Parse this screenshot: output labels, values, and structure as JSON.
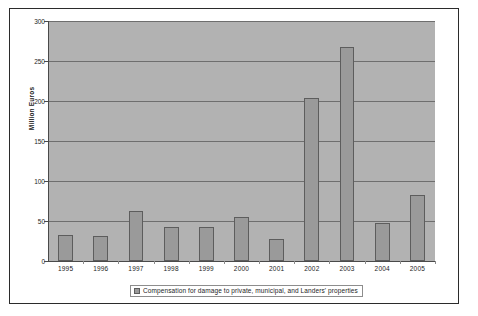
{
  "chart_data": {
    "type": "bar",
    "title": "",
    "subtitle": "",
    "xlabel": "",
    "ylabel": "Million Euros",
    "categories": [
      "1995",
      "1996",
      "1997",
      "1998",
      "1999",
      "2000",
      "2001",
      "2002",
      "2003",
      "2004",
      "2005"
    ],
    "values": [
      32,
      31,
      63,
      43,
      43,
      55,
      27,
      204,
      267,
      48,
      82
    ],
    "series": [
      {
        "name": "Compensation for damage to private, municipal, and Landers' properties",
        "values": [
          32,
          31,
          63,
          43,
          43,
          55,
          27,
          204,
          267,
          48,
          82
        ]
      }
    ],
    "ylim": [
      0,
      300
    ],
    "yticks": [
      0,
      50,
      100,
      150,
      200,
      250,
      300
    ],
    "ytick_labels": [
      "0",
      "50",
      "100",
      "150",
      "200",
      "250",
      "300"
    ],
    "grid": true,
    "legend_position": "bottom",
    "legend_entries": [
      "Compensation for damage to private, municipal, and Landers' properties"
    ],
    "colors": {
      "bar_fill": "#9a9a9a",
      "bar_edge": "#5d5d5d",
      "plot_background": "#b2b2b2",
      "gridline": "#6e6e6e",
      "axis": "#4a4a4a",
      "text": "#1c1c1c",
      "figure_background": "#ffffff",
      "frame_border": "#2b2b2b"
    }
  }
}
